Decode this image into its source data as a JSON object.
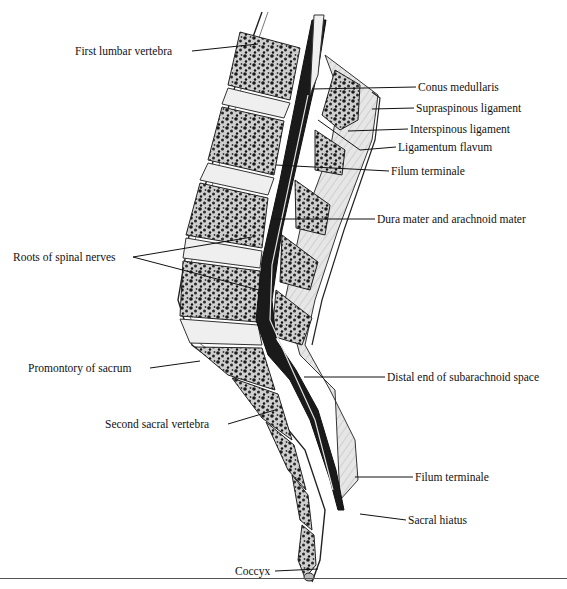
{
  "figure": {
    "labels_left": [
      {
        "id": "first-lumbar-vertebra",
        "text": "First lumbar vertebra",
        "x": 75,
        "y": 45
      },
      {
        "id": "roots-of-spinal-nerves",
        "text": "Roots of spinal nerves",
        "x": 13,
        "y": 251
      },
      {
        "id": "promontory-of-sacrum",
        "text": "Promontory of sacrum",
        "x": 28,
        "y": 362
      },
      {
        "id": "second-sacral-vertebra",
        "text": "Second sacral vertebra",
        "x": 105,
        "y": 418
      },
      {
        "id": "coccyx",
        "text": "Coccyx",
        "x": 235,
        "y": 565
      }
    ],
    "labels_right": [
      {
        "id": "conus-medullaris",
        "text": "Conus medullaris",
        "x": 418,
        "y": 81
      },
      {
        "id": "supraspinous-ligament",
        "text": "Supraspinous ligament",
        "x": 416,
        "y": 102
      },
      {
        "id": "interspinous-ligament",
        "text": "Interspinous ligament",
        "x": 410,
        "y": 123
      },
      {
        "id": "ligamentum-flavum",
        "text": "Ligamentum flavum",
        "x": 398,
        "y": 141
      },
      {
        "id": "filum-terminale-upper",
        "text": "Filum terminale",
        "x": 391,
        "y": 165
      },
      {
        "id": "dura-and-arachnoid",
        "text": "Dura mater and arachnoid mater",
        "x": 377,
        "y": 213
      },
      {
        "id": "distal-end-subarachnoid",
        "text": "Distal end of subarachnoid space",
        "x": 387,
        "y": 371
      },
      {
        "id": "filum-terminale-lower",
        "text": "Filum terminale",
        "x": 415,
        "y": 471
      },
      {
        "id": "sacral-hiatus",
        "text": "Sacral hiatus",
        "x": 408,
        "y": 514
      }
    ],
    "colors": {
      "ink": "#111111",
      "bone_fill": "#d8d8d8",
      "disc_fill": "#efefef",
      "canal_dark": "#1a1a1a",
      "ligament_fill": "#e4e4e4",
      "background": "#ffffff"
    }
  }
}
